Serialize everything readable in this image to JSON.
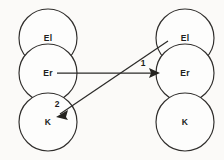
{
  "figure": {
    "kind": "node-link-diagram",
    "background_color": "#fbfaf8",
    "line_color": "#2b2a28",
    "text_color": "#201f1e",
    "node_fill_color": "#fdfdfc"
  },
  "groups": {
    "left": {
      "name": "left-column",
      "nodes": [
        {
          "id": "left-el",
          "label": "El",
          "cx": 48,
          "cy": 38,
          "r": 29
        },
        {
          "id": "left-er",
          "label": "Er",
          "cx": 48,
          "cy": 73,
          "r": 29
        },
        {
          "id": "left-k",
          "label": "K",
          "cx": 48,
          "cy": 122,
          "r": 29
        }
      ]
    },
    "right": {
      "name": "right-column",
      "nodes": [
        {
          "id": "right-el",
          "label": "El",
          "cx": 185,
          "cy": 38,
          "r": 29
        },
        {
          "id": "right-er",
          "label": "Er",
          "cx": 185,
          "cy": 73,
          "r": 29
        },
        {
          "id": "right-k",
          "label": "K",
          "cx": 185,
          "cy": 122,
          "r": 29
        }
      ]
    }
  },
  "edges": [
    {
      "id": "edge-1",
      "label": "1",
      "from": "left-er",
      "to": "right-er",
      "x1": 57,
      "y1": 73,
      "x2": 158,
      "y2": 73,
      "label_x": 143,
      "label_y": 63,
      "style": "straight-horizontal",
      "arrowhead": "at-target"
    },
    {
      "id": "edge-2",
      "label": "2",
      "from": "right-el",
      "to": "left-k",
      "x1": 168,
      "y1": 41,
      "x2": 57,
      "y2": 116,
      "label_x": 57,
      "label_y": 104,
      "style": "straight-diagonal",
      "arrowhead": "at-target"
    }
  ]
}
